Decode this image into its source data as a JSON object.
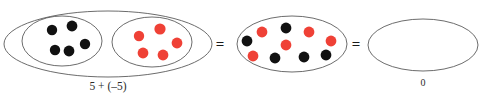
{
  "figure": {
    "background_color": "#ffffff",
    "width": 490,
    "height": 100,
    "outline_color": "#5b5b5b",
    "positive_color": "#111111",
    "negative_color": "#ef4136",
    "text_color": "#2b2b2b"
  },
  "groups": [
    {
      "name": "addends-group",
      "outer_ellipse": {
        "cx": 108,
        "cy": 44,
        "rx": 104,
        "ry": 33
      },
      "caption": "5 + (–5)",
      "caption_x": 108,
      "caption_y": 90,
      "inner_groups": [
        {
          "name": "positive-counters-group",
          "value_label": "5",
          "color_key": "positive",
          "ellipse": {
            "cx": 62,
            "cy": 41,
            "rx": 40,
            "ry": 25
          },
          "dots": [
            {
              "cx": 52,
              "cy": 30,
              "r": 5.2
            },
            {
              "cx": 72,
              "cy": 26,
              "r": 5.4
            },
            {
              "cx": 55,
              "cy": 50,
              "r": 5.2
            },
            {
              "cx": 69,
              "cy": 51,
              "r": 5.4
            },
            {
              "cx": 85,
              "cy": 44,
              "r": 5.2
            }
          ]
        },
        {
          "name": "negative-counters-group",
          "value_label": "-5",
          "color_key": "negative",
          "ellipse": {
            "cx": 152,
            "cy": 42,
            "rx": 40,
            "ry": 25
          },
          "dots": [
            {
              "cx": 139,
              "cy": 36,
              "r": 5.2
            },
            {
              "cx": 160,
              "cy": 29,
              "r": 5.6
            },
            {
              "cx": 143,
              "cy": 53,
              "r": 5.4
            },
            {
              "cx": 163,
              "cy": 55,
              "r": 5.4
            },
            {
              "cx": 177,
              "cy": 43,
              "r": 5.4
            }
          ]
        }
      ]
    },
    {
      "name": "combined-group",
      "outer_ellipse": {
        "cx": 292,
        "cy": 44,
        "rx": 55,
        "ry": 28
      },
      "caption": "",
      "inner_groups": [],
      "dots": [
        {
          "cx": 262,
          "cy": 32,
          "r": 5.4,
          "color_key": "negative"
        },
        {
          "cx": 286,
          "cy": 28,
          "r": 5.4,
          "color_key": "positive"
        },
        {
          "cx": 309,
          "cy": 32,
          "r": 5.4,
          "color_key": "negative"
        },
        {
          "cx": 247,
          "cy": 41,
          "r": 5.4,
          "color_key": "positive"
        },
        {
          "cx": 286,
          "cy": 45,
          "r": 5.4,
          "color_key": "negative"
        },
        {
          "cx": 331,
          "cy": 41,
          "r": 5.4,
          "color_key": "negative"
        },
        {
          "cx": 253,
          "cy": 56,
          "r": 5.4,
          "color_key": "negative"
        },
        {
          "cx": 275,
          "cy": 58,
          "r": 5.4,
          "color_key": "positive"
        },
        {
          "cx": 304,
          "cy": 57,
          "r": 5.4,
          "color_key": "positive"
        },
        {
          "cx": 326,
          "cy": 55,
          "r": 5.4,
          "color_key": "positive"
        }
      ]
    },
    {
      "name": "result-group",
      "outer_ellipse": {
        "cx": 423,
        "cy": 45,
        "rx": 55,
        "ry": 26
      },
      "caption": "0",
      "caption_x": 423,
      "caption_y": 86,
      "inner_groups": [],
      "dots": []
    }
  ],
  "operators": [
    {
      "name": "equals-sign-1",
      "symbol": "=",
      "x": 220,
      "y": 49
    },
    {
      "name": "equals-sign-2",
      "symbol": "=",
      "x": 356,
      "y": 49
    }
  ]
}
